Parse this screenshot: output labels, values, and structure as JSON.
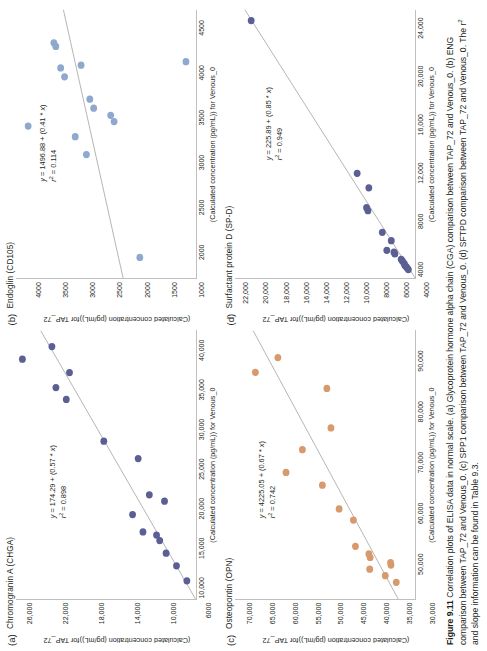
{
  "figure": {
    "number": "Figure 9.11",
    "caption": "Correlation plots of ELISA data in normal scale. (a) Glycoprotein hormone alpha chain (CGA) comparison between TAP_72 and Venous_0. (b) ENG comparison between TAP_72 and Venous_0. (c) SPP1 comparison between TAP_72 and Venous_0. (d) SFTPD comparison between TAP_72 and Venous_0. The r² and slope information can be found in Table 9.3."
  },
  "shared": {
    "y_axis_title_line1": "(Calculated concentration (pg/mL))",
    "y_axis_title_line2": "for TAP_72",
    "x_axis_title_line1": "(Calculated concentration (pg/mL)) for Venous_0"
  },
  "chart_data": [
    {
      "panel": "a",
      "type": "scatter",
      "title": "Chromogranin A (CHGA)",
      "xlabel": "(Calculated concentration (pg/mL)) for Venous_0",
      "ylabel": "(Calculated concentration (pg/mL)) for TAP_72",
      "xlim": [
        8500,
        42500
      ],
      "ylim": [
        5000,
        27500
      ],
      "xticks": [
        10000,
        15000,
        20000,
        25000,
        30000,
        35000,
        40000
      ],
      "xticklabels": [
        "10,000",
        "15,000",
        "20,000",
        "25,000",
        "30,000",
        "35,000",
        "40,000"
      ],
      "yticks": [
        6000,
        10000,
        14000,
        18000,
        22000,
        26000
      ],
      "yticklabels": [
        "6000",
        "10,000",
        "14,000",
        "18,000",
        "22,000",
        "26,000"
      ],
      "equation": "y = 174.29 + (0.57 * x)",
      "r2_label": "r2 = 0.898",
      "r2": 0.898,
      "slope": 0.57,
      "intercept": 174.29,
      "point_color": "#5b5f93",
      "line_color": "#595959",
      "grid": false,
      "legend": "none",
      "points": [
        [
          10800,
          6100
        ],
        [
          12700,
          7400
        ],
        [
          14300,
          8700
        ],
        [
          15900,
          9500
        ],
        [
          16600,
          9900
        ],
        [
          17000,
          11600
        ],
        [
          19200,
          12900
        ],
        [
          20900,
          8900
        ],
        [
          21700,
          10800
        ],
        [
          26300,
          12200
        ],
        [
          28500,
          16500
        ],
        [
          33800,
          21200
        ],
        [
          35300,
          22500
        ],
        [
          37200,
          20800
        ],
        [
          38900,
          26700
        ],
        [
          40500,
          23000
        ]
      ]
    },
    {
      "panel": "b",
      "type": "scatter",
      "title": "Endoglin (CD105)",
      "xlabel": "(Calculated concentration (pg/mL)) for Venous_0",
      "ylabel": "(Calculated concentration (pg/mL)) for TAP_72",
      "xlim": [
        1700,
        4700
      ],
      "ylim": [
        700,
        4400
      ],
      "xticks": [
        2000,
        2500,
        3000,
        3500,
        4000,
        4500
      ],
      "xticklabels": [
        "2000",
        "2500",
        "3000",
        "3500",
        "4000",
        "4500"
      ],
      "yticks": [
        1000,
        1500,
        2000,
        2500,
        3000,
        3500,
        4000
      ],
      "yticklabels": [
        "1000",
        "1500",
        "2000",
        "2500",
        "3000",
        "3500",
        "4000"
      ],
      "equation": "y = 1496.88 + (0.41 * x)",
      "r2_label": "r2 = 0.114",
      "r2": 0.114,
      "slope": 0.41,
      "intercept": 1496.88,
      "point_color": "#8fa8cd",
      "line_color": "#595959",
      "grid": false,
      "legend": "none",
      "points": [
        [
          1930,
          1850
        ],
        [
          3080,
          2950
        ],
        [
          3280,
          3180
        ],
        [
          3400,
          4150
        ],
        [
          3450,
          2380
        ],
        [
          3520,
          2450
        ],
        [
          3600,
          2800
        ],
        [
          3700,
          2880
        ],
        [
          3950,
          3400
        ],
        [
          4050,
          3480
        ],
        [
          4080,
          3060
        ],
        [
          4290,
          3580
        ],
        [
          4330,
          3620
        ],
        [
          4120,
          900
        ]
      ]
    },
    {
      "panel": "c",
      "type": "scatter",
      "title": "Osteopontin (OPN)",
      "xlabel": "(Calculated concentration (pg/mL)) for Venous_0",
      "ylabel": "(Calculated concentration (pg/mL)) for TAP_72",
      "xlim": [
        43000,
        96000
      ],
      "ylim": [
        29000,
        73000
      ],
      "xticks": [
        50000,
        60000,
        70000,
        80000,
        90000
      ],
      "xticklabels": [
        "50,000",
        "60,000",
        "70,000",
        "80,000",
        "90,000"
      ],
      "yticks": [
        30000,
        35000,
        40000,
        45000,
        50000,
        55000,
        60000,
        65000,
        70000
      ],
      "yticklabels": [
        "30,000",
        "35,000",
        "40,000",
        "45,000",
        "50,000",
        "55,000",
        "60,000",
        "65,000",
        "70,000"
      ],
      "equation": "y = 4225.05 + (0.67 * x)",
      "r2_label": "r2 = 0.742",
      "r2": 0.742,
      "slope": 0.67,
      "intercept": 4225.05,
      "point_color": "#d89a6c",
      "line_color": "#595959",
      "grid": false,
      "legend": "none",
      "points": [
        [
          46300,
          33500
        ],
        [
          47600,
          36200
        ],
        [
          48900,
          40000
        ],
        [
          49700,
          34800
        ],
        [
          50200,
          34900
        ],
        [
          51200,
          39900
        ],
        [
          51900,
          40200
        ],
        [
          53400,
          43500
        ],
        [
          58600,
          44000
        ],
        [
          60800,
          47500
        ],
        [
          65500,
          51600
        ],
        [
          68000,
          60500
        ],
        [
          72500,
          56500
        ],
        [
          76800,
          49500
        ],
        [
          84600,
          50500
        ],
        [
          87800,
          68000
        ],
        [
          90700,
          62500
        ]
      ]
    },
    {
      "panel": "d",
      "type": "scatter",
      "title": "Surfactant protein D (SP-D)",
      "xlabel": "(Calculated concentration (pg/mL)) for Venous_0",
      "ylabel": "(Calculated concentration (pg/mL)) for TAP_72",
      "xlim": [
        3200,
        25500
      ],
      "ylim": [
        3000,
        23000
      ],
      "xticks": [
        4000,
        8000,
        12000,
        16000,
        20000,
        24000
      ],
      "xticklabels": [
        "4000",
        "8000",
        "12,000",
        "16,000",
        "20,000",
        "24,000"
      ],
      "yticks": [
        4000,
        6000,
        8000,
        10000,
        12000,
        14000,
        16000,
        18000,
        20000,
        22000
      ],
      "yticklabels": [
        "4000",
        "6000",
        "8000",
        "10,000",
        "12,000",
        "14,000",
        "16,000",
        "18,000",
        "20,000",
        "22,000"
      ],
      "equation": "y = 225.89 + (0.85 * x)",
      "r2_label": "r2 = 0.949",
      "r2": 0.949,
      "slope": 0.85,
      "intercept": 225.89,
      "point_color": "#5b5f93",
      "line_color": "#595959",
      "grid": false,
      "legend": "none",
      "points": [
        [
          3900,
          3700
        ],
        [
          4050,
          3850
        ],
        [
          4150,
          3950
        ],
        [
          4250,
          4100
        ],
        [
          4400,
          4150
        ],
        [
          4600,
          4350
        ],
        [
          4750,
          4500
        ],
        [
          5200,
          5200
        ],
        [
          5350,
          5300
        ],
        [
          5500,
          6100
        ],
        [
          6300,
          5600
        ],
        [
          7000,
          6600
        ],
        [
          8800,
          8200
        ],
        [
          9050,
          8350
        ],
        [
          10700,
          8100
        ],
        [
          11900,
          9400
        ],
        [
          24600,
          21200
        ]
      ]
    }
  ]
}
